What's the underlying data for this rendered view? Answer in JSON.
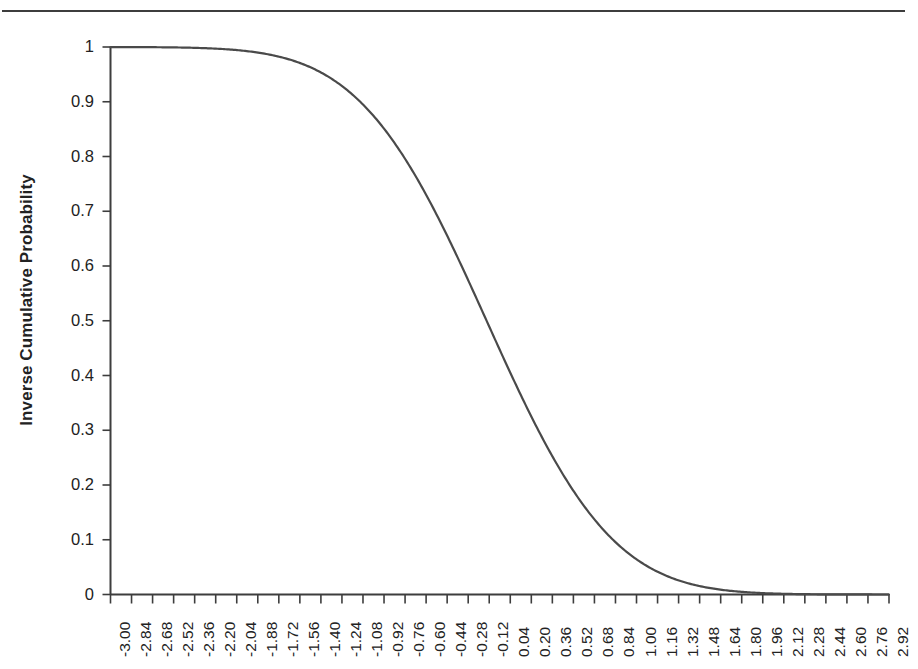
{
  "figure": {
    "background_color": "#ffffff",
    "axis_color": "#3d3d3d",
    "curve_color": "#4a4a4a",
    "rule_visible": true
  },
  "chart_data": {
    "type": "line",
    "title": "",
    "subtitle": "",
    "xlabel": "",
    "ylabel": "Inverse Cumulative Probability",
    "grid": false,
    "legend": false,
    "xlim": [
      -3.0,
      2.92
    ],
    "ylim": [
      0,
      1
    ],
    "y_tick_labels": [
      "1",
      "0.9",
      "0.8",
      "0.7",
      "0.6",
      "0.5",
      "0.4",
      "0.3",
      "0.2",
      "0.1",
      "0"
    ],
    "y_tick_values": [
      1,
      0.9,
      0.8,
      0.7,
      0.6,
      0.5,
      0.4,
      0.3,
      0.2,
      0.1,
      0
    ],
    "x_tick_labels": [
      "-3.00",
      "-2.84",
      "-2.68",
      "-2.52",
      "-2.36",
      "-2.20",
      "-2.04",
      "-1.88",
      "-1.72",
      "-1.56",
      "-1.40",
      "-1.24",
      "-1.08",
      "-0.92",
      "-0.76",
      "-0.60",
      "-0.44",
      "-0.28",
      "-0.12",
      "0.04",
      "0.20",
      "0.36",
      "0.52",
      "0.68",
      "0.84",
      "1.00",
      "1.16",
      "1.32",
      "1.48",
      "1.64",
      "1.80",
      "1.96",
      "2.12",
      "2.28",
      "2.44",
      "2.60",
      "2.76",
      "2.92"
    ],
    "x": [
      -3.0,
      -2.84,
      -2.68,
      -2.52,
      -2.36,
      -2.2,
      -2.04,
      -1.88,
      -1.72,
      -1.56,
      -1.4,
      -1.24,
      -1.08,
      -0.92,
      -0.76,
      -0.6,
      -0.44,
      -0.28,
      -0.12,
      0.04,
      0.2,
      0.36,
      0.52,
      0.68,
      0.84,
      1.0,
      1.16,
      1.32,
      1.48,
      1.64,
      1.8,
      1.96,
      2.12,
      2.28,
      2.44,
      2.6,
      2.76,
      2.92
    ],
    "series": [
      {
        "name": "Inverse Cumulative Probability",
        "values": [
          1.0,
          0.9999,
          0.9998,
          0.9996,
          0.9992,
          0.9985,
          0.9973,
          0.9952,
          0.9918,
          0.9864,
          0.978,
          0.9656,
          0.9477,
          0.923,
          0.8902,
          0.8485,
          0.7977,
          0.7388,
          0.6736,
          0.6049,
          0.5356,
          0.4681,
          0.404,
          0.3448,
          0.2912,
          0.2437,
          0.2022,
          0.1665,
          0.1362,
          0.1106,
          0.0893,
          0.0716,
          0.0571,
          0.0453,
          0.0357,
          0.0279,
          0.0217,
          0.0168
        ]
      }
    ],
    "distribution": {
      "form": "1 - Phi((x - mu)/sigma)",
      "mu": -0.14,
      "sigma": 0.75
    }
  }
}
